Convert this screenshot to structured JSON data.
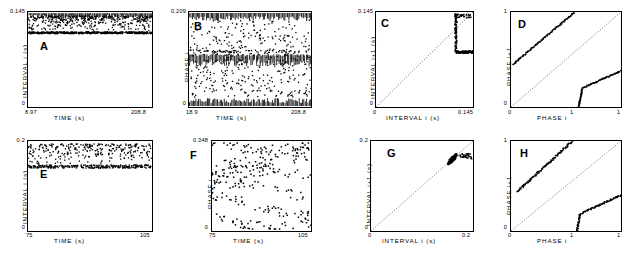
{
  "figure": {
    "panels": [
      {
        "letter": "A",
        "xlabel": "TIME (s)",
        "ylabel": "INTERVAL i (s)",
        "xticks": [
          "8.97",
          "208.8"
        ],
        "yticks": [
          "0",
          "0.145"
        ],
        "xlim": [
          8.97,
          208.8
        ],
        "ylim": [
          0,
          0.145
        ]
      },
      {
        "letter": "B",
        "xlabel": "TIME (s)",
        "ylabel": "PHASE i",
        "xticks": [
          "18.9",
          "208.8"
        ],
        "yticks": [
          "0",
          "0.209"
        ],
        "xlim": [
          18.9,
          208.8
        ],
        "ylim": [
          0,
          0.209
        ]
      },
      {
        "letter": "C",
        "xlabel": "INTERVAL i (s)",
        "ylabel": "INTERVAL i+1 (s)",
        "xticks": [
          "0",
          "0.145"
        ],
        "yticks": [
          "0",
          "0.145"
        ],
        "xlim": [
          0,
          0.145
        ],
        "ylim": [
          0,
          0.145
        ]
      },
      {
        "letter": "D",
        "xlabel": "PHASE i",
        "ylabel": "PHASE i+1",
        "xticks": [
          "0",
          "1",
          "1"
        ],
        "yticks": [
          "0",
          "1"
        ],
        "xlim": [
          0,
          1
        ],
        "ylim": [
          0,
          1
        ]
      },
      {
        "letter": "E",
        "xlabel": "TIME (s)",
        "ylabel": "INTERVAL i (s)",
        "xticks": [
          "75",
          "105"
        ],
        "yticks": [
          "0",
          "0.2"
        ],
        "xlim": [
          75,
          105
        ],
        "ylim": [
          0,
          0.2
        ]
      },
      {
        "letter": "F",
        "xlabel": "TIME (s)",
        "ylabel": "PHASE i",
        "xticks": [
          "75",
          "105"
        ],
        "yticks": [
          "0",
          "0.348"
        ],
        "xlim": [
          75,
          105
        ],
        "ylim": [
          0,
          0.348
        ]
      },
      {
        "letter": "G",
        "xlabel": "INTERVAL i (s)",
        "ylabel": "INTERVAL i+1 (s)",
        "xticks": [
          "0",
          "0.2"
        ],
        "yticks": [
          "0",
          "0.2"
        ],
        "xlim": [
          0,
          0.2
        ],
        "ylim": [
          0,
          0.2
        ]
      },
      {
        "letter": "H",
        "xlabel": "PHASE i",
        "ylabel": "PHASE i+1",
        "xticks": [
          "0",
          "1",
          "1"
        ],
        "yticks": [
          "0",
          "1"
        ],
        "xlim": [
          0,
          1
        ],
        "ylim": [
          0,
          1
        ]
      }
    ]
  },
  "chart_data": [
    {
      "type": "scatter",
      "panel": "A",
      "title": "A",
      "xlabel": "TIME (s)",
      "ylabel": "INTERVAL i (s)",
      "xlim": [
        8.97,
        208.8
      ],
      "ylim": [
        0,
        0.145
      ],
      "grid": false,
      "description": "Dense band of interspike intervals near upper limit with scattered points above a solid baseline ridge.",
      "n_points": 620
    },
    {
      "type": "scatter",
      "panel": "B",
      "title": "B",
      "xlabel": "TIME (s)",
      "ylabel": "PHASE i",
      "xlim": [
        18.9,
        208.8
      ],
      "ylim": [
        0,
        0.209
      ],
      "grid": false,
      "description": "Phase values forming dense horizontal bands at top, middle and bottom with diffuse scatter between.",
      "n_points": 900
    },
    {
      "type": "scatter",
      "panel": "C",
      "title": "C",
      "xlabel": "INTERVAL i (s)",
      "ylabel": "INTERVAL i+1 (s)",
      "xlim": [
        0,
        0.145
      ],
      "ylim": [
        0,
        0.145
      ],
      "grid": false,
      "diagonal": true,
      "description": "Return map: L-shaped dense cluster in upper-right corner against identity diagonal.",
      "n_points": 300
    },
    {
      "type": "scatter",
      "panel": "D",
      "title": "D",
      "xlabel": "PHASE i",
      "ylabel": "PHASE i+1",
      "xlim": [
        0,
        1
      ],
      "ylim": [
        0,
        1
      ],
      "grid": false,
      "diagonal": true,
      "description": "Phase return map: two parallel branches, upper branch from (0,0.45) to (0.55,1), lower branch rising steeply from (0.62,0) then flattening toward (1,0.38).",
      "n_points": 260
    },
    {
      "type": "scatter",
      "panel": "E",
      "title": "E",
      "xlabel": "TIME (s)",
      "ylabel": "INTERVAL i (s)",
      "xlim": [
        75,
        105
      ],
      "ylim": [
        0,
        0.2
      ],
      "grid": false,
      "description": "Interval scatter band between 0.14 and 0.2 with a denser lower ridge near 0.15.",
      "n_points": 420
    },
    {
      "type": "scatter",
      "panel": "F",
      "title": "F",
      "xlabel": "TIME (s)",
      "ylabel": "PHASE i",
      "xlim": [
        75,
        105
      ],
      "ylim": [
        0,
        0.348
      ],
      "grid": false,
      "description": "Sparse phase scatter showing curved striation patterns across the full phase range.",
      "n_points": 300
    },
    {
      "type": "scatter",
      "panel": "G",
      "title": "G",
      "xlabel": "INTERVAL i (s)",
      "ylabel": "INTERVAL i+1 (s)",
      "xlim": [
        0,
        0.2
      ],
      "ylim": [
        0,
        0.2
      ],
      "grid": false,
      "diagonal": true,
      "description": "Return map: tight cluster near (0.16,0.17) on the identity diagonal.",
      "n_points": 300
    },
    {
      "type": "scatter",
      "panel": "H",
      "title": "H",
      "xlabel": "PHASE i",
      "ylabel": "PHASE i+1",
      "xlim": [
        0,
        1
      ],
      "ylim": [
        0,
        1
      ],
      "grid": false,
      "diagonal": true,
      "description": "Phase return map: upper branch from (0.07,0.45) to (0.55,1); lower branch rising from (0.6,0) then flattening to (1,0.4).",
      "n_points": 260
    }
  ]
}
